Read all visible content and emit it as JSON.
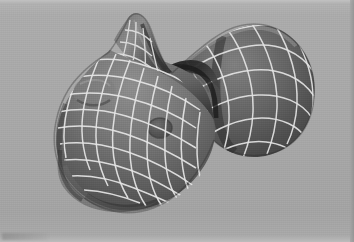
{
  "figure": {
    "render_style": "grayscale diffuse shading",
    "overlay": "white principal-curvature lines",
    "background_label": "flat gray backdrop",
    "media": "scanned halftone print",
    "caption": ""
  },
  "colors": {
    "background": "#a6a6a6",
    "background_top": "#b2b2b2",
    "background_bottom": "#a9a9a9",
    "surface_light": "#8e8e8e",
    "surface_mid": "#6f6f6f",
    "surface_dark": "#4a4a4a",
    "surface_shadow": "#333333",
    "crease_dark": "#262626",
    "curvature_line": "#e8e8e8",
    "curvature_line_soft": "#cfcfcf",
    "spot_dark": "#4e4e4e",
    "edge_dark": "#8f8f8f"
  },
  "parts": [
    {
      "id": "ear",
      "label": "pointed ear",
      "region": "top-left of model"
    },
    {
      "id": "brow",
      "label": "brow bulge",
      "region": "left cheek"
    },
    {
      "id": "muzzle",
      "label": "muzzle / snout lobe",
      "region": "lower-left of model"
    },
    {
      "id": "nostril",
      "label": "dark round depression",
      "region": "center of face"
    },
    {
      "id": "neck-crease",
      "label": "neck crease valley",
      "region": "between head and body"
    },
    {
      "id": "body-lobe",
      "label": "rounded body lobe",
      "region": "right of model"
    }
  ],
  "annotations": {
    "line_count_u": 13,
    "line_count_v": 12,
    "shading_direction": "upper-left key light"
  }
}
